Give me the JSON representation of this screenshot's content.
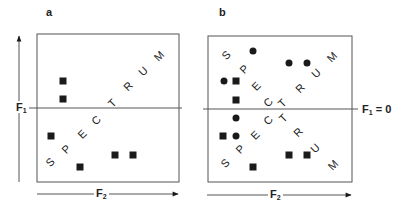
{
  "figure": {
    "panels": [
      {
        "id": "a",
        "label": "a",
        "y_axis": {
          "name": "F",
          "subscript": "1"
        },
        "x_axis": {
          "name": "F",
          "subscript": "2"
        },
        "center_line_label": "",
        "spectrum_word": "SPECTRUM"
      },
      {
        "id": "b",
        "label": "b",
        "x_axis": {
          "name": "F",
          "subscript": "2"
        },
        "center_line_label": {
          "name": "F",
          "subscript": "1",
          "suffix": " = 0"
        },
        "spectrum_word": "SPECTRUM"
      }
    ],
    "colors": {
      "ink": "#1a1a1a",
      "frame": "#555555",
      "background": "#ffffff"
    }
  },
  "chart_data": [
    {
      "type": "scatter",
      "title": "a",
      "xlabel": "F2",
      "ylabel": "F1",
      "box_px": {
        "left": 37,
        "top": 34,
        "right": 179,
        "bottom": 182
      },
      "center_line_y_px": 108,
      "series": [
        {
          "name": "squares",
          "marker": "square",
          "points_px": [
            [
              63,
              81
            ],
            [
              63,
              99
            ],
            [
              51,
              136
            ],
            [
              80,
              167
            ],
            [
              115,
              155
            ],
            [
              133,
              155
            ]
          ]
        }
      ],
      "text_annotations": [
        {
          "text": "S",
          "x": 50,
          "y": 162
        },
        {
          "text": "P",
          "x": 66,
          "y": 149
        },
        {
          "text": "E",
          "x": 82,
          "y": 134
        },
        {
          "text": "C",
          "x": 96,
          "y": 120
        },
        {
          "text": "T",
          "x": 112,
          "y": 103
        },
        {
          "text": "R",
          "x": 128,
          "y": 86
        },
        {
          "text": "U",
          "x": 143,
          "y": 71
        },
        {
          "text": "M",
          "x": 159,
          "y": 56
        }
      ]
    },
    {
      "type": "scatter",
      "title": "b",
      "xlabel": "F2",
      "ylabel": "",
      "box_px": {
        "left": 208,
        "top": 36,
        "right": 352,
        "bottom": 182
      },
      "center_line_y_px": 109,
      "center_line_label": "F1 = 0",
      "series": [
        {
          "name": "squares",
          "marker": "square",
          "points_px": [
            [
              236,
              81
            ],
            [
              236,
              100
            ],
            [
              223,
              136
            ],
            [
              253,
              167
            ],
            [
              289,
              155
            ],
            [
              307,
              155
            ]
          ]
        },
        {
          "name": "circles",
          "marker": "circle",
          "points_px": [
            [
              253,
              51
            ],
            [
              224,
              81
            ],
            [
              289,
              63
            ],
            [
              307,
              63
            ],
            [
              236,
              118
            ],
            [
              236,
              136
            ]
          ]
        }
      ],
      "text_annotations": [
        {
          "text": "S",
          "x": 226,
          "y": 55
        },
        {
          "text": "P",
          "x": 244,
          "y": 69
        },
        {
          "text": "E",
          "x": 256,
          "y": 86
        },
        {
          "text": "C",
          "x": 268,
          "y": 102
        },
        {
          "text": "T",
          "x": 282,
          "y": 103
        },
        {
          "text": "R",
          "x": 300,
          "y": 88
        },
        {
          "text": "U",
          "x": 316,
          "y": 73
        },
        {
          "text": "M",
          "x": 332,
          "y": 57
        },
        {
          "text": "S",
          "x": 225,
          "y": 163
        },
        {
          "text": "P",
          "x": 240,
          "y": 149
        },
        {
          "text": "E",
          "x": 255,
          "y": 135
        },
        {
          "text": "C",
          "x": 268,
          "y": 120
        },
        {
          "text": "T",
          "x": 283,
          "y": 118
        },
        {
          "text": "R",
          "x": 298,
          "y": 132
        },
        {
          "text": "U",
          "x": 315,
          "y": 148
        },
        {
          "text": "M",
          "x": 333,
          "y": 165
        }
      ]
    }
  ]
}
